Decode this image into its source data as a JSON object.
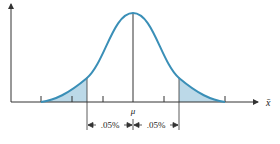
{
  "diagram": {
    "type": "normal-distribution",
    "x_axis_label": "x̄",
    "center_label": "μ",
    "left_interval_label": ".05%",
    "right_interval_label": ".05%",
    "curve_color": "#3a8fb7",
    "shade_color": "#bcd9e8",
    "axis_color": "#333333"
  }
}
